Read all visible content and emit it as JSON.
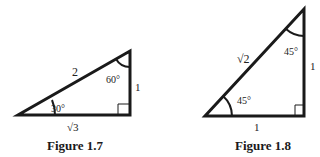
{
  "figures": [
    {
      "caption": "Figure 1.7",
      "triangle": "30-60-90",
      "sides": {
        "hypotenuse": "2",
        "vertical": "1",
        "base": "√3"
      },
      "angles": {
        "bottom_left": "30°",
        "top_right": "60°"
      },
      "right_angle": "bottom-right"
    },
    {
      "caption": "Figure 1.8",
      "triangle": "45-45-90",
      "sides": {
        "hypotenuse": "√2",
        "vertical": "1",
        "base": "1"
      },
      "angles": {
        "bottom_left": "45°",
        "top_right": "45°"
      },
      "right_angle": "bottom-right"
    }
  ],
  "colors": {
    "stroke": "#1a1a1a",
    "background": "#ffffff"
  }
}
